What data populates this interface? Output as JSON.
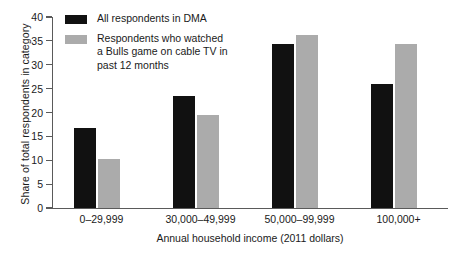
{
  "chart_data": {
    "type": "bar",
    "title": "",
    "subtitle": "",
    "xlabel": "Annual household income (2011 dollars)",
    "ylabel": "Share of total respondents in category",
    "categories": [
      "0–29,999",
      "30,000–49,999",
      "50,000–99,999",
      "100,000+"
    ],
    "series": [
      {
        "name": "All respondents in DMA",
        "color": "#111111",
        "values": [
          16.7,
          23.5,
          34.3,
          26.0
        ]
      },
      {
        "name": "Respondents who watched\na Bulls game on cable TV in\npast 12 months",
        "color": "#ababab",
        "values": [
          10.3,
          19.5,
          36.2,
          34.3
        ]
      }
    ],
    "ylim": [
      0,
      40
    ],
    "yticks": [
      0,
      5,
      10,
      15,
      20,
      25,
      30,
      35,
      40
    ],
    "ytick_labels": [
      "0",
      "5",
      "10",
      "15",
      "20",
      "25",
      "30",
      "35",
      "40"
    ],
    "grid": false,
    "legend_position": "top-left"
  },
  "axes": {
    "y_title": "Share of total respondents in category",
    "x_title": "Annual household income (2011 dollars)"
  },
  "legend": {
    "entries": [
      {
        "label": "All respondents in DMA",
        "swatch": "dark"
      },
      {
        "label": "Respondents who watched\na Bulls game on cable TV in\npast 12 months",
        "swatch": "light"
      }
    ]
  },
  "colors": {
    "series_dark": "#111111",
    "series_light": "#ababab",
    "axis": "#5a5a5a",
    "text": "#1a1a1a",
    "background": "#ffffff"
  }
}
